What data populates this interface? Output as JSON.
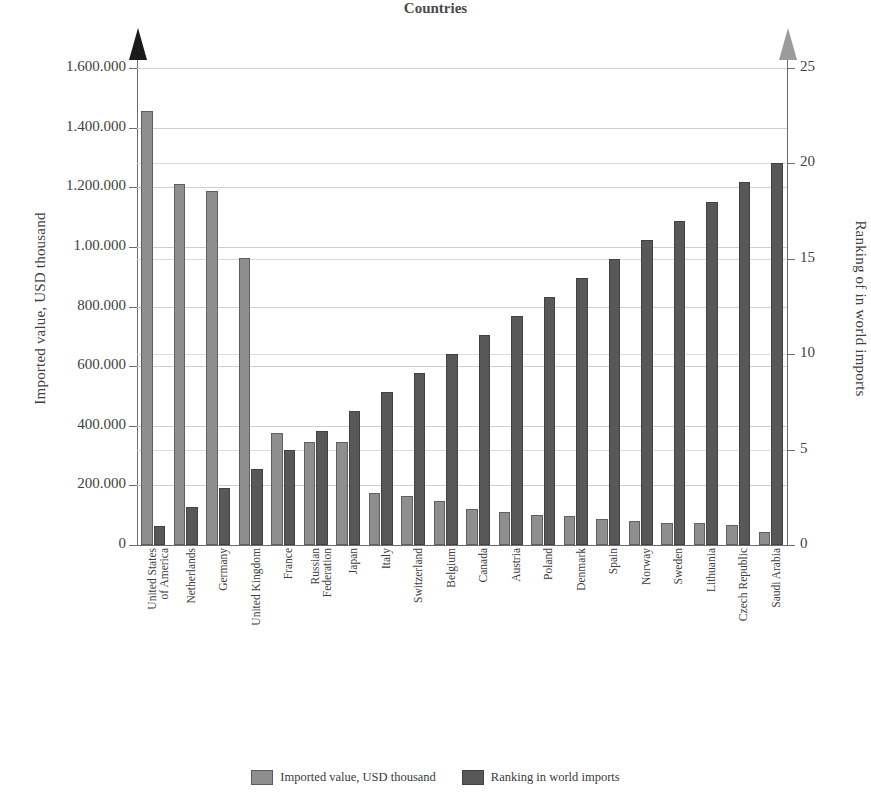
{
  "chart_data": {
    "type": "bar",
    "title": "",
    "subtitle": "",
    "xlabel": "Countries",
    "ylabel": "Imported value, USD thousand",
    "y2label": "Ranking of in world imports",
    "grid": true,
    "legend_position": "bottom",
    "categories": [
      "United States of America",
      "Netherlands",
      "Germany",
      "United Kingdom",
      "France",
      "Russian Federation",
      "Japan",
      "Italy",
      "Switzerland",
      "Belgium",
      "Canada",
      "Austria",
      "Poland",
      "Denmark",
      "Spain",
      "Norway",
      "Sweden",
      "Lithuania",
      "Czech Republic",
      "Saudi Arabia"
    ],
    "category_lines": [
      [
        "United States",
        "of America"
      ],
      [
        "Netherlands"
      ],
      [
        "Germany"
      ],
      [
        "United Kingdom"
      ],
      [
        "France"
      ],
      [
        "Russian",
        "Federation"
      ],
      [
        "Japan"
      ],
      [
        "Italy"
      ],
      [
        "Switzerland"
      ],
      [
        "Belgium"
      ],
      [
        "Canada"
      ],
      [
        "Austria"
      ],
      [
        "Poland"
      ],
      [
        "Denmark"
      ],
      [
        "Spain"
      ],
      [
        "Norway"
      ],
      [
        "Sweden"
      ],
      [
        "Lithuania"
      ],
      [
        "Czech Republic"
      ],
      [
        "Saudi Arabia"
      ]
    ],
    "series": [
      {
        "name": "Imported value, USD thousand",
        "axis": "left",
        "color": "#8e8e8e",
        "values": [
          1455000,
          1210000,
          1188000,
          963000,
          376000,
          346000,
          345000,
          176000,
          165000,
          146000,
          122000,
          110000,
          100000,
          99000,
          86000,
          81000,
          74000,
          74000,
          68000,
          42000
        ]
      },
      {
        "name": "Ranking in world imports",
        "axis": "right",
        "color": "#585858",
        "values": [
          1,
          2,
          3,
          4,
          5,
          6,
          7,
          8,
          9,
          10,
          11,
          12,
          13,
          14,
          15,
          16,
          17,
          18,
          19,
          20
        ]
      }
    ],
    "ylim": [
      0,
      1600000
    ],
    "y2lim": [
      0,
      25
    ],
    "yticks": [
      0,
      200000,
      400000,
      600000,
      800000,
      1000000,
      1200000,
      1400000,
      1600000
    ],
    "ytick_labels": [
      "0",
      "200.000",
      "400.000",
      "600.000",
      "800.000",
      "1.00.000",
      "1.200.000",
      "1.400.000",
      "1.600.000"
    ],
    "y2ticks": [
      0,
      5,
      10,
      15,
      20,
      25
    ],
    "y2tick_labels": [
      "0",
      "5",
      "10",
      "15",
      "20",
      "25"
    ]
  },
  "legend": {
    "items": [
      {
        "label": "Imported value, USD thousand",
        "color": "#8e8e8e"
      },
      {
        "label": "Ranking in world imports",
        "color": "#585858"
      }
    ]
  },
  "colors": {
    "value_bar": "#8e8e8e",
    "ranking_bar": "#585858",
    "axis": "#6d6d6d",
    "grid": "#cfcfcf",
    "left_arrow": "#1b1b1b",
    "right_arrow": "#9b9b9b"
  }
}
